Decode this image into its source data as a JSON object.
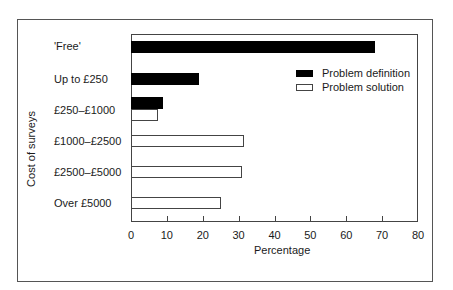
{
  "chart_data": {
    "type": "bar",
    "orientation": "horizontal",
    "title": "",
    "xlabel": "Percentage",
    "ylabel": "Cost of surveys",
    "xlim": [
      0,
      80
    ],
    "xticks": [
      "0",
      "10",
      "20",
      "30",
      "40",
      "50",
      "60",
      "70",
      "80"
    ],
    "categories": [
      "'Free'",
      "Up to £250",
      "£250–£1000",
      "£1000–£2500",
      "£2500–£5000",
      "Over £5000"
    ],
    "series": [
      {
        "name": "Problem definition",
        "color": "#000000",
        "values": [
          68,
          19,
          9,
          0,
          0,
          0
        ]
      },
      {
        "name": "Problem solution",
        "color": "#ffffff",
        "values": [
          0,
          0,
          7.5,
          31.5,
          31,
          25
        ]
      }
    ],
    "legend_position": "upper right inside",
    "grid": false
  }
}
